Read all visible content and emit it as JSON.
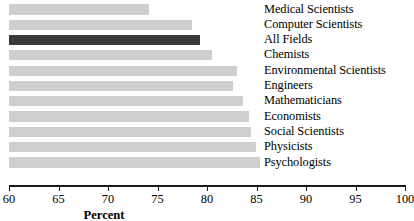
{
  "chart_data": {
    "type": "bar",
    "orientation": "horizontal",
    "title": "",
    "xlabel": "Percent",
    "ylabel": "",
    "xlim": [
      60,
      100
    ],
    "xticks": [
      60,
      65,
      70,
      75,
      80,
      85,
      90,
      95,
      100
    ],
    "xtick_labels": [
      "60",
      "65",
      "70",
      "75",
      "80",
      "85",
      "90",
      "95",
      "100"
    ],
    "grid": false,
    "legend": "none",
    "categories": [
      "Medical Scientists",
      "Computer Scientists",
      "All Fields",
      "Chemists",
      "Environmental Scientists",
      "Engineers",
      "Mathematicians",
      "Economists",
      "Social Scientists",
      "Physicists",
      "Psychologists"
    ],
    "values": [
      74.1,
      78.5,
      79.3,
      80.5,
      83.0,
      82.6,
      83.6,
      84.2,
      84.4,
      84.9,
      85.4
    ],
    "bars": [
      {
        "label": "Medical Scientists",
        "value": 74.1,
        "color": "#cfcfcf",
        "highlight": false
      },
      {
        "label": "Computer Scientists",
        "value": 78.5,
        "color": "#cfcfcf",
        "highlight": false
      },
      {
        "label": "All Fields",
        "value": 79.3,
        "color": "#3a3a3a",
        "highlight": true
      },
      {
        "label": "Chemists",
        "value": 80.5,
        "color": "#cfcfcf",
        "highlight": false
      },
      {
        "label": "Environmental Scientists",
        "value": 83.0,
        "color": "#cfcfcf",
        "highlight": false
      },
      {
        "label": "Engineers",
        "value": 82.6,
        "color": "#cfcfcf",
        "highlight": false
      },
      {
        "label": "Mathematicians",
        "value": 83.6,
        "color": "#cfcfcf",
        "highlight": false
      },
      {
        "label": "Economists",
        "value": 84.2,
        "color": "#cfcfcf",
        "highlight": false
      },
      {
        "label": "Social Scientists",
        "value": 84.4,
        "color": "#cfcfcf",
        "highlight": false
      },
      {
        "label": "Physicists",
        "value": 84.9,
        "color": "#cfcfcf",
        "highlight": false
      },
      {
        "label": "Psychologists",
        "value": 85.4,
        "color": "#cfcfcf",
        "highlight": false
      }
    ],
    "colors": {
      "bar": "#cfcfcf",
      "bar_highlight": "#3a3a3a",
      "axis": "#1a1a1a",
      "text": "#000000",
      "background": "#ffffff"
    }
  }
}
